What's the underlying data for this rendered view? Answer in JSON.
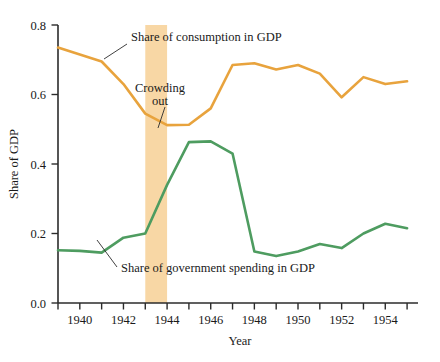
{
  "chart_data": {
    "type": "line",
    "title": "",
    "xlabel": "Year",
    "ylabel": "Share of GDP",
    "xlim": [
      1939,
      1955.5
    ],
    "ylim": [
      0.0,
      0.8
    ],
    "grid": false,
    "legend_position": "inline-annotations",
    "x_tick_labels": [
      "1940",
      "1942",
      "1944",
      "1946",
      "1948",
      "1950",
      "1952",
      "1954"
    ],
    "x_tick_values": [
      1940,
      1942,
      1944,
      1946,
      1948,
      1950,
      1952,
      1954
    ],
    "x_minor_ticks": [
      1939,
      1941,
      1943,
      1945,
      1947,
      1949,
      1951,
      1953,
      1955
    ],
    "y_tick_labels": [
      "0.0",
      "0.2",
      "0.4",
      "0.6",
      "0.8"
    ],
    "y_tick_values": [
      0.0,
      0.2,
      0.4,
      0.6,
      0.8
    ],
    "x": [
      1939,
      1940,
      1941,
      1942,
      1943,
      1944,
      1945,
      1946,
      1947,
      1948,
      1949,
      1950,
      1951,
      1952,
      1953,
      1954,
      1955
    ],
    "series": [
      {
        "name": "Share of consumption in GDP",
        "color": "#E8A33D",
        "values": [
          0.735,
          0.715,
          0.695,
          0.63,
          0.545,
          0.512,
          0.513,
          0.56,
          0.685,
          0.69,
          0.672,
          0.685,
          0.66,
          0.592,
          0.65,
          0.63,
          0.638
        ]
      },
      {
        "name": "Share of government spending in GDP",
        "color": "#4E9C60",
        "values": [
          0.152,
          0.15,
          0.145,
          0.188,
          0.2,
          0.34,
          0.463,
          0.465,
          0.43,
          0.148,
          0.135,
          0.148,
          0.17,
          0.158,
          0.2,
          0.228,
          0.215
        ]
      }
    ],
    "highlight_band": {
      "label": "Crowding out",
      "color": "#F8D7A5",
      "x_start": 1943,
      "x_end": 1944
    },
    "annotations": [
      {
        "name": "consumption-label",
        "text": "Share of consumption in GDP"
      },
      {
        "name": "crowding-out-label-line1",
        "text": "Crowding"
      },
      {
        "name": "crowding-out-label-line2",
        "text": "out"
      },
      {
        "name": "government-label",
        "text": "Share of government spending in GDP"
      }
    ]
  },
  "axes": {
    "y_title": "Share of GDP",
    "x_title": "Year"
  }
}
